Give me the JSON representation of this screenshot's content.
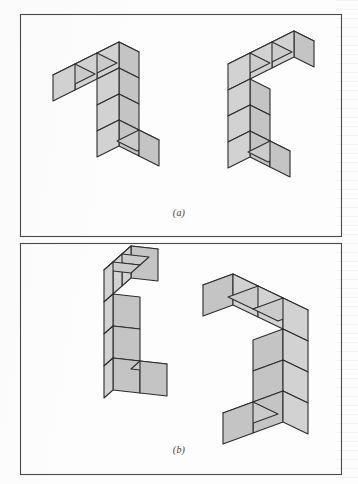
{
  "figure": {
    "kind": "mental-rotation-cube-figures",
    "background_color": "#fdfdfd",
    "frame": {
      "stroke_color": "#4a4a4a",
      "fill": "none",
      "outer": {
        "x": 20,
        "y": 14,
        "width": 321,
        "height": 460
      },
      "divider_y": 236
    },
    "cube": {
      "top_fill": "#cbcbcb",
      "left_fill": "#c4c4c4",
      "right_fill": "#d2d2d2",
      "stroke_color": "#2d2d2d",
      "stroke_width": 1.1
    },
    "panels": [
      {
        "id": "a",
        "caption": "(a)",
        "caption_position": {
          "x": 179,
          "y": 215
        },
        "bounds": {
          "x": 20,
          "y": 14,
          "width": 321,
          "height": 222
        },
        "figures": [
          {
            "id": "a-left",
            "name": "left-cube-figure",
            "origin": {
              "x": 97,
              "y": 79
            },
            "projection": {
              "ux": 22,
              "uy": -11,
              "vx": 20,
              "vy": 10,
              "wx": 0,
              "wy": -26
            },
            "cubes": [
              {
                "u": 0,
                "v": 0,
                "w": 0
              },
              {
                "u": -1,
                "v": 0,
                "w": 0
              },
              {
                "u": -2,
                "v": 0,
                "w": 0
              },
              {
                "u": 0,
                "v": 0,
                "w": -1
              },
              {
                "u": 0,
                "v": 0,
                "w": -2
              },
              {
                "u": 0,
                "v": 0,
                "w": -3
              },
              {
                "u": 0,
                "v": 1,
                "w": -3
              }
            ]
          },
          {
            "id": "a-right",
            "name": "right-cube-figure",
            "origin": {
              "x": 228,
              "y": 90
            },
            "projection": {
              "ux": 22,
              "uy": -11,
              "vx": 20,
              "vy": 10,
              "wx": 0,
              "wy": -26
            },
            "cubes": [
              {
                "u": 0,
                "v": 0,
                "w": 0
              },
              {
                "u": 1,
                "v": 0,
                "w": 0
              },
              {
                "u": 2,
                "v": 0,
                "w": 0
              },
              {
                "u": 0,
                "v": 0,
                "w": -1
              },
              {
                "u": 0,
                "v": 0,
                "w": -2
              },
              {
                "u": 0,
                "v": 0,
                "w": -3
              },
              {
                "u": 0,
                "v": 1,
                "w": -3
              }
            ]
          }
        ]
      },
      {
        "id": "b",
        "caption": "(b)",
        "caption_position": {
          "x": 179,
          "y": 452
        },
        "bounds": {
          "x": 20,
          "y": 243,
          "width": 321,
          "height": 231
        },
        "figures": [
          {
            "id": "b-left",
            "name": "left-cube-figure",
            "origin": {
              "x": 104,
              "y": 302
            },
            "projection": {
              "ux": 9,
              "uy": -8,
              "vx": 27,
              "vy": 3,
              "wx": 0,
              "wy": -32
            },
            "cubes": [
              {
                "u": 0,
                "v": 0,
                "w": 0
              },
              {
                "u": 1,
                "v": 0,
                "w": 0
              },
              {
                "u": 2,
                "v": 0,
                "w": 0
              },
              {
                "u": 0,
                "v": 0,
                "w": -1
              },
              {
                "u": 0,
                "v": 0,
                "w": -2
              },
              {
                "u": 0,
                "v": 0,
                "w": -3
              },
              {
                "u": 0,
                "v": 1,
                "w": -3
              }
            ]
          },
          {
            "id": "b-right",
            "name": "right-cube-figure",
            "origin": {
              "x": 253,
              "y": 309
            },
            "projection": {
              "ux": 25,
              "uy": 12,
              "vx": 30,
              "vy": -11,
              "wx": 0,
              "wy": 31
            },
            "cubes": [
              {
                "u": 0,
                "v": 0,
                "w": 0
              },
              {
                "u": -1,
                "v": 0,
                "w": 0
              },
              {
                "u": -2,
                "v": 0,
                "w": 0
              },
              {
                "u": 0,
                "v": 0,
                "w": 1
              },
              {
                "u": 0,
                "v": 0,
                "w": 2
              },
              {
                "u": 0,
                "v": 0,
                "w": 3
              },
              {
                "u": 0,
                "v": -1,
                "w": 3
              }
            ]
          }
        ]
      }
    ]
  }
}
